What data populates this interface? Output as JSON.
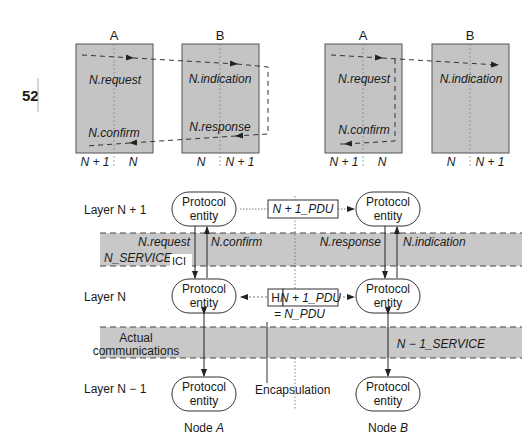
{
  "page_number": "52",
  "top_diagrams": [
    {
      "name": "confirmed-service",
      "node_a": {
        "label": "A",
        "primitives": [
          "N.request",
          "N.confirm"
        ],
        "bottom_labels": [
          "N + 1",
          "N"
        ]
      },
      "node_b": {
        "label": "B",
        "primitives": [
          "N.indication",
          "N.response"
        ],
        "bottom_labels": [
          "N",
          "N + 1"
        ]
      }
    },
    {
      "name": "locally-confirmed-service",
      "node_a": {
        "label": "A",
        "primitives": [
          "N.request",
          "N.confirm"
        ],
        "bottom_labels": [
          "N + 1",
          "N"
        ]
      },
      "node_b": {
        "label": "B",
        "primitives": [
          "N.indication"
        ],
        "bottom_labels": [
          "N",
          "N + 1"
        ]
      }
    }
  ],
  "layers": {
    "upper": "Layer N + 1",
    "middle": "Layer N",
    "lower": "Layer N − 1"
  },
  "entity_label_line1": "Protocol",
  "entity_label_line2": "entity",
  "service_band_upper": {
    "name": "N_SERVICE",
    "ici": "ICI",
    "node_a_down": "N.request",
    "node_a_up": "N.confirm",
    "node_b_down": "N.response",
    "node_b_up": "N.indication"
  },
  "service_band_lower": {
    "left_label_line1": "Actual",
    "left_label_line2": "communications",
    "right_label": "N − 1_SERVICE"
  },
  "pdu": {
    "upper": "N + 1_PDU",
    "header": "H",
    "middle": "N + 1_PDU",
    "equals": "= N_PDU"
  },
  "encapsulation_label": "Encapsulation",
  "nodes": {
    "a_prefix": "Node ",
    "a_name": "A",
    "b_prefix": "Node ",
    "b_name": "B"
  },
  "colors": {
    "panel_fill": "#c4c4c4",
    "band_fill": "#c8c8c8",
    "stroke": "#333333"
  }
}
